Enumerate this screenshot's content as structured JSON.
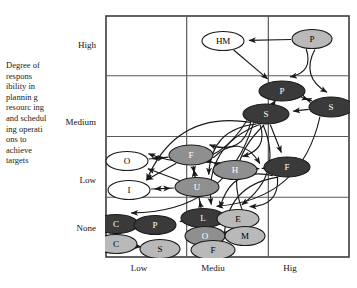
{
  "axes": {
    "y_caption": "Degree of respons ibility in plannin g resourc ing and schedul ing operati ons to achieve targets",
    "y_ticks": [
      "High",
      "Medium",
      "Low",
      "None"
    ],
    "x_ticks": [
      "Low",
      "Mediu",
      "Hig"
    ]
  },
  "colors": {
    "frame": "#3c3c3c",
    "grid": "#5a5a5a",
    "node_white": "#ffffff",
    "node_light": "#b9b9b9",
    "node_mid": "#8f8f8f",
    "node_dark": "#3a3a3a",
    "node_stroke": "#1a1a1a",
    "edge": "#1a1a1a"
  },
  "chart_data": {
    "type": "scatter",
    "title": "",
    "xlabel": "",
    "ylabel": "Degree of responsibility in planning resourcing and scheduling operations to achieve targets",
    "xlim": [
      "Low",
      "Medium",
      "High"
    ],
    "ylim": [
      "None",
      "Low",
      "Medium",
      "High"
    ],
    "grid": true,
    "legend": "none",
    "nodes": [
      {
        "label": "HM",
        "x": 118,
        "y": 26,
        "rx": 21,
        "ry": 9.5,
        "fill": "white",
        "text": "light"
      },
      {
        "label": "P",
        "x": 207,
        "y": 24,
        "rx": 20,
        "ry": 9.5,
        "fill": "light",
        "text": "light"
      },
      {
        "label": "P",
        "x": 177,
        "y": 76,
        "rx": 23,
        "ry": 10,
        "fill": "dark",
        "text": "dark"
      },
      {
        "label": "S",
        "x": 226,
        "y": 92,
        "rx": 22,
        "ry": 10,
        "fill": "dark",
        "text": "dark"
      },
      {
        "label": "S",
        "x": 161,
        "y": 99,
        "rx": 23,
        "ry": 10,
        "fill": "dark",
        "text": "dark"
      },
      {
        "label": "F",
        "x": 86,
        "y": 140,
        "rx": 22,
        "ry": 10,
        "fill": "mid",
        "text": "dark"
      },
      {
        "label": "F",
        "x": 182,
        "y": 152,
        "rx": 23,
        "ry": 10,
        "fill": "dark",
        "text": "dark"
      },
      {
        "label": "H",
        "x": 130,
        "y": 155,
        "rx": 22,
        "ry": 9.5,
        "fill": "mid",
        "text": "dark"
      },
      {
        "label": "U",
        "x": 92,
        "y": 172,
        "rx": 22,
        "ry": 9.5,
        "fill": "mid",
        "text": "dark"
      },
      {
        "label": "O",
        "x": 22,
        "y": 146,
        "rx": 21,
        "ry": 9.5,
        "fill": "white",
        "text": "light"
      },
      {
        "label": "I",
        "x": 24,
        "y": 175,
        "rx": 21,
        "ry": 9.5,
        "fill": "white",
        "text": "light"
      },
      {
        "label": "L",
        "x": 98,
        "y": 203,
        "rx": 22,
        "ry": 9.5,
        "fill": "dark",
        "text": "dark"
      },
      {
        "label": "E",
        "x": 133,
        "y": 204,
        "rx": 21,
        "ry": 9.5,
        "fill": "light",
        "text": "light"
      },
      {
        "label": "C",
        "x": 11,
        "y": 209,
        "rx": 22,
        "ry": 9.5,
        "fill": "dark",
        "text": "dark"
      },
      {
        "label": "P",
        "x": 50,
        "y": 210,
        "rx": 21,
        "ry": 9.5,
        "fill": "dark",
        "text": "dark"
      },
      {
        "label": "O",
        "x": 100,
        "y": 221,
        "rx": 20,
        "ry": 9.5,
        "fill": "mid",
        "text": "dark"
      },
      {
        "label": "M",
        "x": 140,
        "y": 221,
        "rx": 20,
        "ry": 9.5,
        "fill": "light",
        "text": "light"
      },
      {
        "label": "C",
        "x": 11,
        "y": 229,
        "rx": 21,
        "ry": 9.5,
        "fill": "light",
        "text": "light"
      },
      {
        "label": "S",
        "x": 55,
        "y": 234,
        "rx": 20,
        "ry": 9.5,
        "fill": "light",
        "text": "light"
      },
      {
        "label": "F",
        "x": 108,
        "y": 235,
        "rx": 22,
        "ry": 9.5,
        "fill": "light",
        "text": "light"
      }
    ],
    "grid_cols": 3,
    "grid_rows": 4
  }
}
